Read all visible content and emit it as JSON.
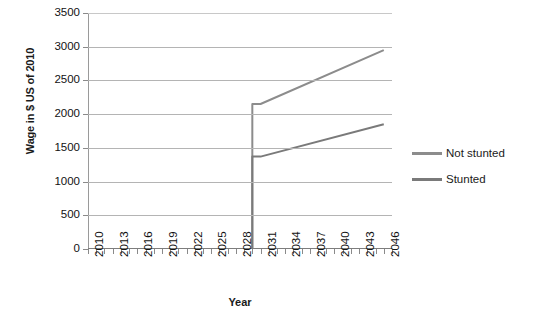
{
  "chart_data": {
    "type": "line",
    "title": "",
    "xlabel": "Year",
    "ylabel": "Wage in $ US of 2010",
    "xlim": [
      2010,
      2047
    ],
    "ylim": [
      0,
      3500
    ],
    "ytick_step": 500,
    "yticks": [
      3500,
      3000,
      2500,
      2000,
      1500,
      1000,
      500,
      0
    ],
    "xticks_labeled": [
      2010,
      2013,
      2016,
      2019,
      2022,
      2025,
      2028,
      2031,
      2034,
      2037,
      2040,
      2043,
      2046
    ],
    "xtick_minor_every": 1,
    "grid": "horizontal",
    "legend_position": "right",
    "series": [
      {
        "name": "Not stunted",
        "color": "#8c8c8c",
        "x": [
          2030,
          2030,
          2031,
          2046
        ],
        "values": [
          0,
          2150,
          2150,
          2950
        ]
      },
      {
        "name": "Stunted",
        "color": "#7a7a7a",
        "x": [
          2030,
          2030,
          2031,
          2046
        ],
        "values": [
          0,
          1370,
          1370,
          1850
        ]
      }
    ]
  },
  "legend": {
    "items": [
      {
        "label": "Not stunted"
      },
      {
        "label": "Stunted"
      }
    ]
  }
}
